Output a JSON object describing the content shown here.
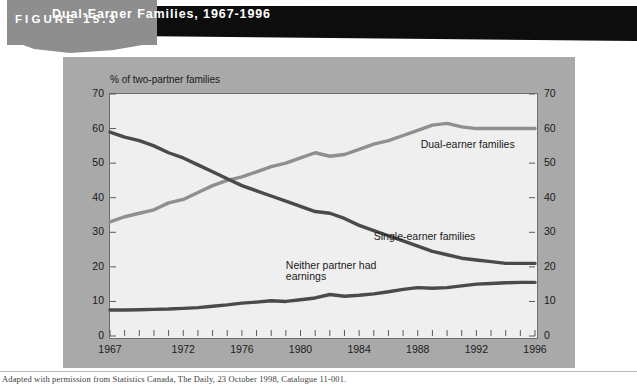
{
  "header": {
    "figure_label": "FIGURE 15.3",
    "title": "Dual-Earner Families, 1967-1996",
    "title_bar_color": "#0d0d0d",
    "tab_color": "#8e8e8e"
  },
  "footer": {
    "source": "Adapted with permission from Statistics Canada, The Daily, 23 October 1998, Catalogue 11-001."
  },
  "panel": {
    "background_color": "#a9a9a9",
    "plot_background_color": "#efefef"
  },
  "chart_data": {
    "type": "line",
    "title": "Dual-Earner Families, 1967-1996",
    "ylabel": "% of two-partner families",
    "xlabel": "",
    "ylim": [
      0,
      70
    ],
    "ytick_values": [
      0,
      10,
      20,
      30,
      40,
      50,
      60,
      70
    ],
    "ytick_labels": [
      "0",
      "10",
      "20",
      "30",
      "40",
      "50",
      "60",
      "70"
    ],
    "ytick_labels_right": [
      "0",
      "10",
      "20",
      "30",
      "40",
      "50",
      "60",
      "70"
    ],
    "xlim": [
      1967,
      1996
    ],
    "xtick_values": [
      1967,
      1972,
      1976,
      1980,
      1984,
      1988,
      1992,
      1996
    ],
    "xtick_labels": [
      "1967",
      "1972",
      "1976",
      "1980",
      "1984",
      "1988",
      "1992",
      "1996"
    ],
    "minor_xticks": "every year 1967-1996",
    "grid": false,
    "legend_position": "inline-annotations",
    "x": [
      1967,
      1968,
      1969,
      1970,
      1971,
      1972,
      1973,
      1974,
      1975,
      1976,
      1977,
      1978,
      1979,
      1980,
      1981,
      1982,
      1983,
      1984,
      1985,
      1986,
      1987,
      1988,
      1989,
      1990,
      1991,
      1992,
      1993,
      1994,
      1995,
      1996
    ],
    "series": [
      {
        "name": "Dual-earner families",
        "color": "#8f8f8f",
        "values": [
          33.0,
          34.5,
          35.5,
          36.5,
          38.5,
          39.5,
          41.5,
          43.5,
          45.0,
          46.0,
          47.5,
          49.0,
          50.0,
          51.5,
          53.0,
          52.0,
          52.5,
          54.0,
          55.5,
          56.5,
          58.0,
          59.5,
          61.0,
          61.5,
          60.5,
          60.0,
          60.0,
          60.0,
          60.0,
          60.0
        ]
      },
      {
        "name": "Single-earner families",
        "color": "#4a4a4a",
        "values": [
          59.0,
          57.5,
          56.5,
          55.0,
          53.0,
          51.5,
          49.5,
          47.5,
          45.5,
          43.5,
          42.0,
          40.5,
          39.0,
          37.5,
          36.0,
          35.5,
          34.0,
          32.0,
          30.5,
          29.0,
          27.5,
          26.0,
          24.5,
          23.5,
          22.5,
          22.0,
          21.5,
          21.0,
          21.0,
          21.0
        ]
      },
      {
        "name": "Neither partner had earnings",
        "color": "#4a4a4a",
        "values": [
          7.5,
          7.5,
          7.6,
          7.7,
          7.8,
          8.0,
          8.2,
          8.6,
          9.0,
          9.5,
          9.8,
          10.2,
          10.0,
          10.5,
          11.0,
          12.0,
          11.5,
          11.8,
          12.2,
          12.8,
          13.5,
          14.0,
          13.8,
          14.0,
          14.5,
          15.0,
          15.2,
          15.4,
          15.5,
          15.5
        ]
      }
    ],
    "annotations": [
      {
        "text": "Dual-earner families",
        "series": "Dual-earner families"
      },
      {
        "text": "Single-earner families",
        "series": "Single-earner families"
      },
      {
        "text": "Neither partner had",
        "series": "Neither partner had earnings"
      },
      {
        "text": "earnings",
        "series": "Neither partner had earnings"
      }
    ]
  }
}
